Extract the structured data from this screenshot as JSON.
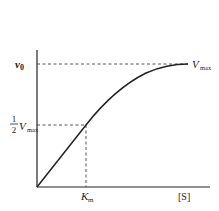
{
  "diagram": {
    "colors": {
      "line": "#222222",
      "dash": "#444444",
      "background": "#ffffff"
    },
    "y_axis": {
      "top_label_main": "v",
      "top_label_sub": "0"
    },
    "half_vmax_label": {
      "fraction_num": "1",
      "fraction_den": "2",
      "main": "V",
      "sub": "max"
    },
    "vmax_label": {
      "main": "V",
      "sub": "max"
    },
    "km_label": {
      "main": "K",
      "sub": "m"
    },
    "x_axis_label": "[S]"
  }
}
